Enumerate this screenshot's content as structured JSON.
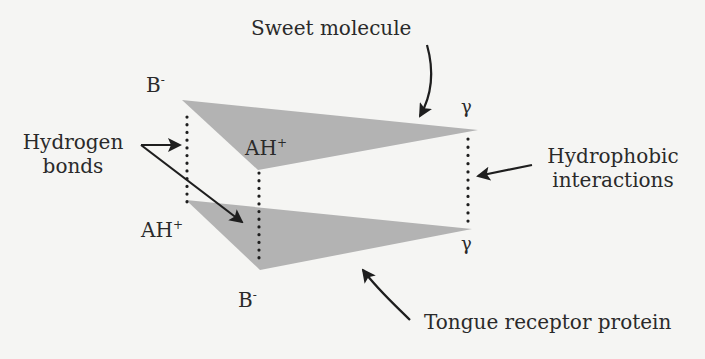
{
  "labels": {
    "sweet_molecule": "Sweet molecule",
    "hydrogen_bonds_line1": "Hydrogen",
    "hydrogen_bonds_line2": "bonds",
    "hydrophobic_line1": "Hydrophobic",
    "hydrophobic_line2": "interactions",
    "tongue_receptor": "Tongue receptor protein"
  },
  "sites": {
    "top_b_base": "B",
    "top_b_charge": "-",
    "top_ah_base": "AH",
    "top_ah_charge": "+",
    "top_gamma": "γ",
    "bottom_ah_base": "AH",
    "bottom_ah_charge": "+",
    "bottom_b_base": "B",
    "bottom_b_charge": "-",
    "bottom_gamma": "γ"
  },
  "colors": {
    "background": "#f5f5f3",
    "shape_fill": "#b3b3b3",
    "ink": "#1e1e1e"
  }
}
